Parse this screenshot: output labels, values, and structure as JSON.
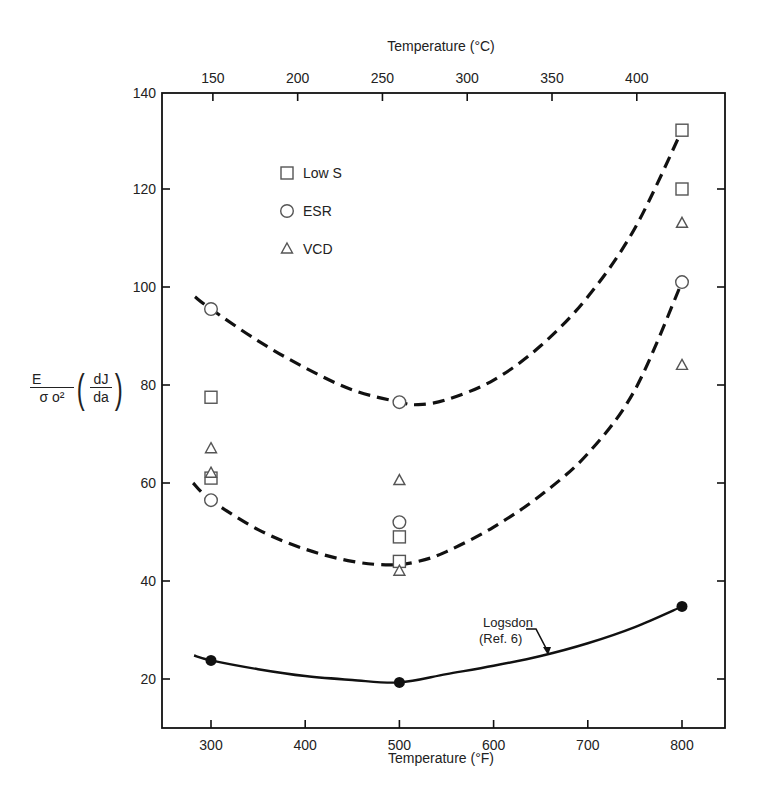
{
  "chart_data": {
    "type": "scatter",
    "title": "",
    "xlabel": "Temperature (°F)",
    "x2label": "Temperature (°C)",
    "ylabel": {
      "numerator": "E",
      "denominator_sigma": "σ",
      "denominator_sub": "o",
      "denominator_sup": "2",
      "deriv_num": "dJ",
      "deriv_den": "da",
      "text": "E/σo² (dJ/da)"
    },
    "xlim": [
      248,
      846
    ],
    "ylim": [
      10,
      140
    ],
    "xticks": [
      300,
      400,
      500,
      600,
      700,
      800
    ],
    "x2ticks_celsius": [
      150,
      200,
      250,
      300,
      350,
      400
    ],
    "yticks": [
      20,
      40,
      60,
      80,
      100,
      120,
      140
    ],
    "grid": false,
    "legend": {
      "position": "upper-left",
      "entries": [
        {
          "label": "Low S",
          "marker": "square"
        },
        {
          "label": "ESR",
          "marker": "circle"
        },
        {
          "label": "VCD",
          "marker": "triangle"
        }
      ]
    },
    "series": [
      {
        "name": "Low S",
        "marker": "square",
        "x": [
          300,
          300,
          500,
          500,
          800,
          800
        ],
        "y": [
          77.5,
          61,
          49,
          44,
          132,
          120
        ]
      },
      {
        "name": "ESR",
        "marker": "circle",
        "x": [
          300,
          300,
          500,
          500,
          800
        ],
        "y": [
          95.5,
          56.5,
          76.5,
          52,
          101
        ]
      },
      {
        "name": "VCD",
        "marker": "triangle",
        "x": [
          300,
          300,
          500,
          500,
          800,
          800
        ],
        "y": [
          67,
          62,
          60.5,
          42,
          113,
          84
        ]
      },
      {
        "name": "Logsdon (Ref. 6)",
        "marker": "filled-circle",
        "line": "solid",
        "x": [
          300,
          500,
          800
        ],
        "y": [
          23.8,
          19.3,
          34.8
        ]
      }
    ],
    "curves": [
      {
        "name": "upper-envelope",
        "style": "dashed",
        "x": [
          283,
          300,
          350,
          400,
          450,
          500,
          520,
          550,
          600,
          650,
          700,
          750,
          800
        ],
        "y": [
          98,
          95.5,
          89,
          83.5,
          79,
          76.5,
          76,
          77,
          81,
          88,
          98,
          112,
          132
        ]
      },
      {
        "name": "lower-envelope",
        "style": "dashed",
        "x": [
          281,
          300,
          350,
          400,
          450,
          490,
          520,
          550,
          600,
          650,
          700,
          750,
          800
        ],
        "y": [
          60,
          56.5,
          50.5,
          46.5,
          44,
          43.3,
          44,
          46,
          51,
          57.5,
          66,
          79,
          101
        ]
      },
      {
        "name": "Logsdon (Ref. 6)",
        "style": "solid",
        "x": [
          282,
          300,
          350,
          400,
          450,
          500,
          550,
          600,
          650,
          700,
          750,
          800
        ],
        "y": [
          24.8,
          23.8,
          22,
          20.6,
          19.8,
          19.3,
          21,
          22.7,
          24.7,
          27.3,
          30.6,
          34.8
        ]
      }
    ],
    "annotations": [
      {
        "text_line1": "Logsdon",
        "text_line2": "(Ref. 6)",
        "arrow_to_x": 660,
        "arrow_to_y": 25.5
      }
    ]
  },
  "labels": {
    "xlabel": "Temperature (°F)",
    "x2label": "Temperature (°C)",
    "anno1": "Logsdon",
    "anno2": "(Ref. 6)",
    "y_num": "E",
    "y_den": "σ o²",
    "y_dnum": "dJ",
    "y_dden": "da"
  }
}
